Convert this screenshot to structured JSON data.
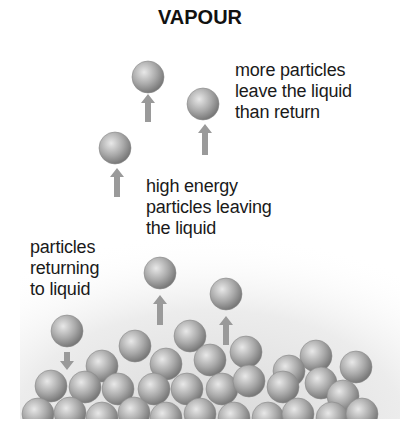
{
  "title": "VAPOUR",
  "labels": {
    "more_particles": "more particles\nleave the liquid\nthan return",
    "high_energy": "high energy\nparticles leaving\nthe liquid",
    "returning": "particles\nreturning\nto liquid"
  },
  "colors": {
    "particle_light": "#e6e6e6",
    "particle_mid": "#a8a8a8",
    "particle_dark": "#6f6f6f",
    "arrow": "#9a9a9a",
    "text": "#1a1a1a"
  },
  "counts": {
    "vapour_particles_leaving": 5,
    "particles_returning": 1
  }
}
